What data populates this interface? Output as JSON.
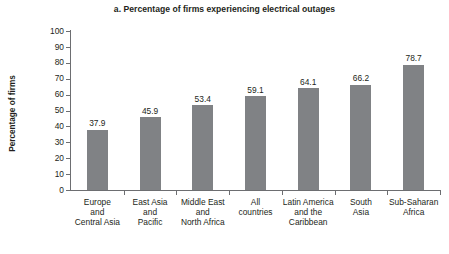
{
  "chart_data": {
    "type": "bar",
    "title": "a. Percentage of firms experiencing electrical outages",
    "xlabel": "",
    "ylabel": "Percentage of firms",
    "ylim": [
      0,
      100
    ],
    "ytick_step": 10,
    "grid": false,
    "legend": null,
    "bar_color": "#808285",
    "axis_color": "#6d6e71",
    "text_color": "#231f20",
    "categories": [
      "Europe and Central Asia",
      "East Asia and Pacific",
      "Middle East and North Africa",
      "All countries",
      "Latin America and the Caribbean",
      "South Asia",
      "Sub-Saharan Africa"
    ],
    "category_lines": [
      [
        "Europe",
        "and",
        "Central Asia"
      ],
      [
        "East Asia",
        "and",
        "Pacific"
      ],
      [
        "Middle East",
        "and",
        "North Africa"
      ],
      [
        "All",
        "countries"
      ],
      [
        "Latin America",
        "and the",
        "Caribbean"
      ],
      [
        "South",
        "Asia"
      ],
      [
        "Sub-Saharan",
        "Africa"
      ]
    ],
    "values": [
      37.9,
      45.9,
      53.4,
      59.1,
      64.1,
      66.2,
      78.7
    ],
    "value_labels": [
      "37.9",
      "45.9",
      "53.4",
      "59.1",
      "64.1",
      "66.2",
      "78.7"
    ],
    "yticks": [
      0,
      10,
      20,
      30,
      40,
      50,
      60,
      70,
      80,
      90,
      100
    ],
    "ytick_labels": [
      "0",
      "10",
      "20",
      "30",
      "40",
      "50",
      "60",
      "70",
      "80",
      "90",
      "100"
    ]
  }
}
